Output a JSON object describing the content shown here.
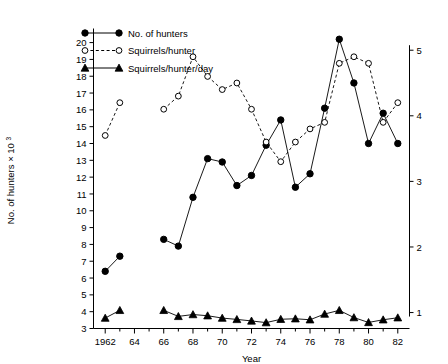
{
  "chart_data": {
    "type": "line",
    "title": "",
    "xlabel": "Year",
    "ylabel": "No. of hunters × 10",
    "ylabel_sup": "3",
    "y2label": "",
    "grid": false,
    "legend_position": "top-left",
    "xlim": [
      1961.2,
      1982.8
    ],
    "ylim": [
      3,
      20.6
    ],
    "y2lim": [
      0.757,
      5.27
    ],
    "xticks": [
      1962,
      1964,
      1966,
      1968,
      1970,
      1972,
      1974,
      1976,
      1978,
      1980,
      1982
    ],
    "xticklabels": [
      "1962",
      "64",
      "66",
      "68",
      "70",
      "72",
      "74",
      "76",
      "78",
      "80",
      "82"
    ],
    "xminorticks": [
      1963,
      1965,
      1967,
      1969,
      1971,
      1973,
      1975,
      1977,
      1979,
      1981
    ],
    "yticks": [
      3,
      4,
      5,
      6,
      7,
      8,
      9,
      10,
      11,
      12,
      13,
      14,
      15,
      16,
      17,
      18,
      19,
      20
    ],
    "yticklabels": [
      "3",
      "4",
      "5",
      "6",
      "7",
      "8",
      "9",
      "10",
      "11",
      "12",
      "13",
      "14",
      "15",
      "16",
      "17",
      "18",
      "19",
      "20"
    ],
    "y2ticks": [
      1,
      2,
      3,
      4,
      5
    ],
    "y2ticklabels": [
      "1",
      "2",
      "3",
      "4",
      "5"
    ],
    "series": [
      {
        "name": "No. of hunters",
        "legend_label": "No. of hunters",
        "marker": "filled-circle",
        "linestyle": "solid",
        "axis": "left",
        "x": [
          1962,
          1963,
          1966,
          1967,
          1968,
          1969,
          1970,
          1971,
          1972,
          1973,
          1974,
          1975,
          1976,
          1977,
          1978,
          1979,
          1980,
          1981,
          1982
        ],
        "values": [
          6.4,
          7.3,
          8.3,
          7.9,
          10.8,
          13.1,
          12.9,
          11.5,
          12.1,
          13.9,
          15.4,
          11.4,
          12.2,
          16.1,
          20.2,
          17.6,
          14.0,
          15.8,
          14.0
        ]
      },
      {
        "name": "Squirrels/hunter",
        "legend_label": "Squirrels/hunter",
        "marker": "open-circle",
        "linestyle": "dashed",
        "axis": "right",
        "x": [
          1962,
          1963,
          1966,
          1967,
          1968,
          1969,
          1970,
          1971,
          1972,
          1973,
          1974,
          1975,
          1976,
          1977,
          1978,
          1979,
          1980,
          1981,
          1982
        ],
        "values": [
          3.7,
          4.2,
          4.1,
          4.3,
          4.9,
          4.6,
          4.4,
          4.5,
          4.1,
          3.6,
          3.3,
          3.6,
          3.8,
          3.9,
          4.8,
          4.9,
          4.8,
          3.9,
          4.2
        ]
      },
      {
        "name": "Squirrels/hunter/day",
        "legend_label": "Squirrels/hunter/day",
        "marker": "filled-triangle",
        "linestyle": "solid",
        "axis": "left",
        "x": [
          1962,
          1963,
          1966,
          1967,
          1968,
          1969,
          1970,
          1971,
          1972,
          1973,
          1974,
          1975,
          1976,
          1977,
          1978,
          1979,
          1980,
          1981,
          1982
        ],
        "values": [
          3.62,
          4.08,
          4.08,
          3.72,
          3.83,
          3.76,
          3.62,
          3.54,
          3.45,
          3.35,
          3.55,
          3.58,
          3.52,
          3.86,
          4.08,
          3.65,
          3.36,
          3.52,
          3.64
        ]
      }
    ]
  },
  "colors": {
    "ink": "#000000",
    "background": "#ffffff",
    "marker_fill_open": "#ffffff"
  }
}
